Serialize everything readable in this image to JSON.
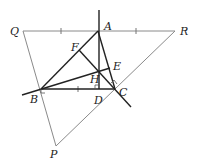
{
  "diagram": {
    "points": {
      "A": {
        "x": 98,
        "y": 31,
        "label": "A"
      },
      "B": {
        "x": 41,
        "y": 89,
        "label": "B"
      },
      "C": {
        "x": 115,
        "y": 89,
        "label": "C"
      },
      "D": {
        "x": 99,
        "y": 89,
        "label": "D"
      },
      "E": {
        "x": 110,
        "y": 68,
        "label": "E"
      },
      "F": {
        "x": 79,
        "y": 50,
        "label": "F"
      },
      "H": {
        "x": 99,
        "y": 71,
        "label": "H"
      },
      "P": {
        "x": 56,
        "y": 146,
        "label": "P"
      },
      "Q": {
        "x": 23,
        "y": 31,
        "label": "Q"
      },
      "R": {
        "x": 175,
        "y": 31,
        "label": "R"
      }
    },
    "colors": {
      "thick": "#222222",
      "thin": "#888888"
    }
  }
}
